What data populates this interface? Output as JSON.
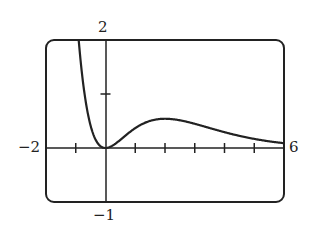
{
  "chart_data": {
    "type": "line",
    "title": "",
    "function": "y = x^2 e^(-x)",
    "xlabel": "",
    "ylabel": "",
    "xlim": [
      -2,
      6
    ],
    "ylim": [
      -1,
      2
    ],
    "xtick_step": 1,
    "ytick_step": 1,
    "grid": false,
    "legend": false,
    "labels": {
      "xmin": "−2",
      "xmax": "6",
      "ymin": "−1",
      "ymax": "2"
    },
    "series": [
      {
        "name": "f(x)",
        "x": [
          -0.9,
          -0.75,
          -0.5,
          -0.25,
          0,
          0.5,
          1,
          1.5,
          2,
          2.5,
          3,
          3.5,
          4,
          4.5,
          5,
          5.5,
          6
        ],
        "values": [
          1.99,
          1.19,
          0.41,
          0.08,
          0,
          0.15,
          0.37,
          0.5,
          0.54,
          0.51,
          0.45,
          0.37,
          0.29,
          0.22,
          0.17,
          0.12,
          0.09
        ]
      }
    ]
  }
}
